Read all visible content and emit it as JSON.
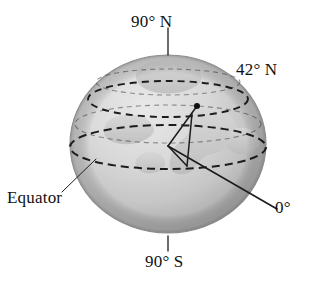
{
  "figure": {
    "name": "latitude-globe-diagram",
    "background_color": "#ffffff",
    "ink_color": "#111111"
  },
  "labels": {
    "north_pole": "90° N",
    "latitude_42n": "42° N",
    "equator": "Equator",
    "prime_zero": "0°",
    "south_pole": "90° S"
  },
  "globe": {
    "center_x": 168,
    "center_y": 144,
    "radius_x": 98,
    "radius_y": 89,
    "fill_light": "#f2f2f2",
    "fill_mid": "#c9c9c9",
    "fill_dark": "#9a9a9a",
    "land_color": "#d8d8d8"
  },
  "circles": [
    {
      "name": "arctic-circle",
      "label": "",
      "cy": 82,
      "rx": 72,
      "ry": 13,
      "dash": "5 4",
      "opacity": 0.45
    },
    {
      "name": "latitude-42n-circle",
      "label": "42° N",
      "cy": 99,
      "rx": 80,
      "ry": 18,
      "dash": "7 5",
      "opacity": 1
    },
    {
      "name": "tropic-circle",
      "label": "",
      "cy": 124,
      "rx": 93,
      "ry": 19,
      "dash": "5 4",
      "opacity": 0.45
    },
    {
      "name": "equator-circle",
      "label": "Equator",
      "cy": 147,
      "rx": 98,
      "ry": 22,
      "dash": "8 5",
      "opacity": 1
    }
  ],
  "angle_marker": {
    "vertex_x": 168,
    "vertex_y": 146,
    "point_x": 197,
    "point_y": 106,
    "drop_x": 187,
    "drop_y": 165,
    "dot_radius": 3,
    "angle_value": "42°"
  },
  "leader_lines": [
    {
      "name": "north-pole-tick",
      "x1": 168,
      "y1": 28,
      "x2": 168,
      "y2": 55
    },
    {
      "name": "south-pole-tick",
      "x1": 168,
      "y1": 236,
      "x2": 168,
      "y2": 251
    },
    {
      "name": "equator-leader",
      "x1": 62,
      "y1": 192,
      "x2": 96,
      "y2": 159
    },
    {
      "name": "zero-degree-leader",
      "x1": 168,
      "y1": 146,
      "x2": 276,
      "y2": 208
    }
  ]
}
